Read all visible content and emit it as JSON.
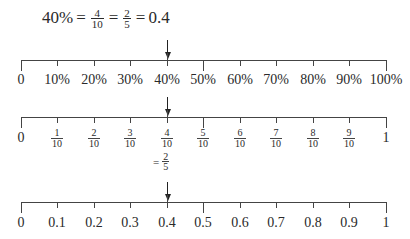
{
  "equation": {
    "percent": "40%",
    "eq1": "=",
    "frac1": {
      "num": "4",
      "den": "10"
    },
    "eq2": "=",
    "frac2": {
      "num": "2",
      "den": "5"
    },
    "eq3": "=",
    "decimal": "0.4"
  },
  "line_percent": {
    "labels": [
      "0",
      "10%",
      "20%",
      "30%",
      "40%",
      "50%",
      "60%",
      "70%",
      "80%",
      "90%",
      "100%"
    ],
    "arrow_at": "40%"
  },
  "line_fraction": {
    "start_label": "0",
    "end_label": "1",
    "fractions": [
      {
        "num": "1",
        "den": "10"
      },
      {
        "num": "2",
        "den": "10"
      },
      {
        "num": "3",
        "den": "10"
      },
      {
        "num": "4",
        "den": "10"
      },
      {
        "num": "5",
        "den": "10"
      },
      {
        "num": "6",
        "den": "10"
      },
      {
        "num": "7",
        "den": "10"
      },
      {
        "num": "8",
        "den": "10"
      },
      {
        "num": "9",
        "den": "10"
      }
    ],
    "arrow_at": "4/10",
    "equivalence": {
      "eq": "=",
      "num": "2",
      "den": "5"
    }
  },
  "line_decimal": {
    "labels": [
      "0",
      "0.1",
      "0.2",
      "0.3",
      "0.4",
      "0.5",
      "0.6",
      "0.7",
      "0.8",
      "0.9",
      "1"
    ],
    "arrow_at": "0.4"
  }
}
